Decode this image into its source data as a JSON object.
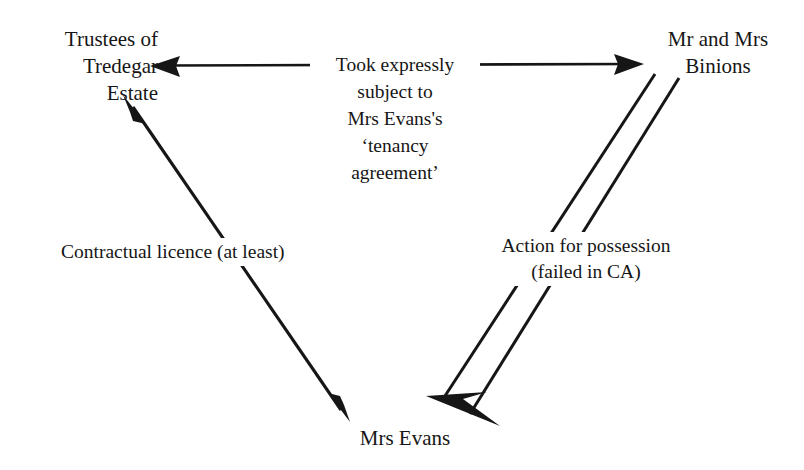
{
  "diagram": {
    "background_color": "#ffffff",
    "ink_color": "#161616",
    "nodes": [
      {
        "id": "trustees",
        "label": "Trustees of\nTredegar\nEstate",
        "position": "top-left"
      },
      {
        "id": "binions",
        "label": "Mr and Mrs\nBinions",
        "position": "top-right"
      },
      {
        "id": "mrs_evans",
        "label": "Mrs Evans",
        "position": "bottom-center"
      }
    ],
    "edges": [
      {
        "id": "conveyance",
        "label": "Took expressly\nsubject to\nMrs Evans's\n‘tenancy\nagreement’",
        "from": "binions",
        "to": "trustees",
        "style": "single-line",
        "arrowheads": "both",
        "orientation": "horizontal"
      },
      {
        "id": "licence",
        "label": "Contractual licence (at least)",
        "from": "trustees",
        "to": "mrs_evans",
        "style": "single-line",
        "arrowheads": "both",
        "orientation": "diagonal-left"
      },
      {
        "id": "possession_action",
        "label": "Action for possession\n(failed in CA)",
        "from": "binions",
        "to": "mrs_evans",
        "style": "double-line",
        "arrowheads": "target-only",
        "orientation": "diagonal-right"
      }
    ]
  }
}
